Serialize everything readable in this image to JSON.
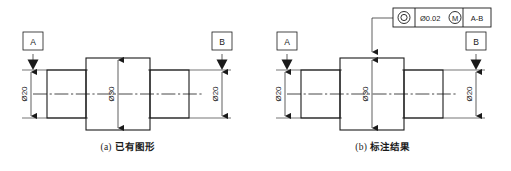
{
  "document": {
    "kind": "engineering-drawing",
    "language": "zh-CN",
    "background_color": "#ffffff",
    "line_color": "#1a1a1a"
  },
  "figures": [
    {
      "id": "a",
      "caption_index": "(a)",
      "caption_text": "已有图形",
      "datums": [
        {
          "label": "A",
          "position": "left"
        },
        {
          "label": "B",
          "position": "right"
        }
      ],
      "dimensions": [
        {
          "label": "Ø20",
          "value": 20,
          "symbol": "Ø",
          "position": "left",
          "orientation": "vertical"
        },
        {
          "label": "Ø30",
          "value": 30,
          "symbol": "Ø",
          "position": "center",
          "orientation": "vertical"
        },
        {
          "label": "Ø20",
          "value": 20,
          "symbol": "Ø",
          "position": "right",
          "orientation": "vertical"
        }
      ],
      "feature_control_frame": null
    },
    {
      "id": "b",
      "caption_index": "(b)",
      "caption_text": "标注结果",
      "datums": [
        {
          "label": "A",
          "position": "left"
        },
        {
          "label": "B",
          "position": "right"
        }
      ],
      "dimensions": [
        {
          "label": "Ø20",
          "value": 20,
          "symbol": "Ø",
          "position": "left",
          "orientation": "vertical"
        },
        {
          "label": "Ø30",
          "value": 30,
          "symbol": "Ø",
          "position": "center",
          "orientation": "vertical"
        },
        {
          "label": "Ø20",
          "value": 20,
          "symbol": "Ø",
          "position": "right",
          "orientation": "vertical"
        }
      ],
      "feature_control_frame": {
        "symbol_name": "coaxiality-symbol",
        "tolerance_value": "Ø0.02",
        "material_condition": "M",
        "datum_reference": "A-B"
      }
    }
  ]
}
